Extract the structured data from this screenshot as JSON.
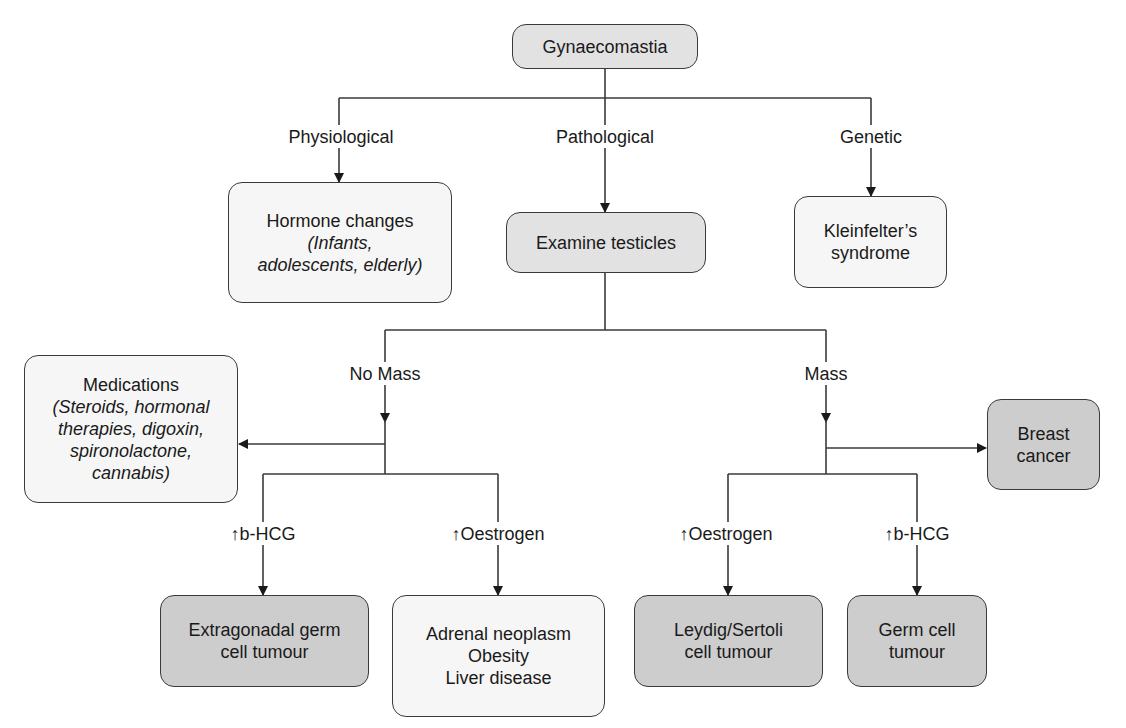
{
  "root": {
    "label": "Gynaecomastia"
  },
  "branches": {
    "physiological": {
      "label": "Physiological"
    },
    "pathological": {
      "label": "Pathological"
    },
    "genetic": {
      "label": "Genetic"
    }
  },
  "nodes": {
    "hormone_changes": {
      "title": "Hormone changes",
      "detail_1": "(Infants,",
      "detail_2": "adolescents, elderly)"
    },
    "examine_testicles": {
      "label": "Examine testicles"
    },
    "kleinfelter": {
      "line_1": "Kleinfelter’s",
      "line_2": "syndrome"
    },
    "medications": {
      "title": "Medications",
      "detail_1": "(Steroids, hormonal",
      "detail_2": "therapies, digoxin,",
      "detail_3": "spironolactone,",
      "detail_4": "cannabis)"
    },
    "breast_cancer": {
      "line_1": "Breast",
      "line_2": "cancer"
    },
    "extragonadal": {
      "line_1": "Extragonadal germ",
      "line_2": "cell tumour"
    },
    "adrenal": {
      "line_1": "Adrenal neoplasm",
      "line_2": "Obesity",
      "line_3": "Liver disease"
    },
    "leydig": {
      "line_1": "Leydig/Sertoli",
      "line_2": "cell tumour"
    },
    "germ_cell": {
      "line_1": "Germ cell",
      "line_2": "tumour"
    }
  },
  "edge_labels": {
    "no_mass": "No Mass",
    "mass": "Mass",
    "no_mass_bhcg": "↑b-HCG",
    "no_mass_oestrogen": "↑Oestrogen",
    "mass_oestrogen": "↑Oestrogen",
    "mass_bhcg": "↑b-HCG"
  },
  "colors": {
    "line": "#3a3a3a",
    "box_light": "#f6f6f6",
    "box_mid": "#e2e2e2",
    "box_dark": "#cdcdcd"
  }
}
